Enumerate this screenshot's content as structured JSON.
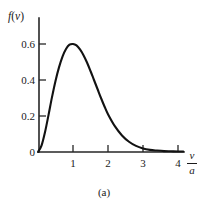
{
  "figure": {
    "caption": "(a)",
    "background_color": "#ffffff",
    "ink_color": "#1a1a1a"
  },
  "chart_data": {
    "type": "line",
    "title": "",
    "subtitle": "",
    "xlabel": "v/a",
    "xlabel_numerator": "v",
    "xlabel_denominator": "a",
    "ylabel": "f(v)",
    "xlim": [
      0,
      4.35
    ],
    "ylim": [
      0,
      0.68
    ],
    "grid": false,
    "legend": false,
    "xticks": [
      1,
      2,
      3,
      4
    ],
    "xtick_labels": [
      "1",
      "2",
      "3",
      "4"
    ],
    "yticks": [
      0,
      0.2,
      0.4,
      0.6
    ],
    "ytick_labels": [
      "0",
      "0.2",
      "0.4",
      "0.6"
    ],
    "series": [
      {
        "name": "f(v)",
        "color": "#121212",
        "x": [
          0.0,
          0.1,
          0.2,
          0.3,
          0.4,
          0.5,
          0.6,
          0.7,
          0.8,
          0.9,
          1.0,
          1.1,
          1.2,
          1.3,
          1.4,
          1.5,
          1.6,
          1.7,
          1.8,
          1.9,
          2.0,
          2.2,
          2.4,
          2.6,
          2.8,
          3.0,
          3.2,
          3.4,
          3.6,
          3.8,
          4.0,
          4.15
        ],
        "y": [
          0.0,
          0.035,
          0.11,
          0.205,
          0.305,
          0.395,
          0.47,
          0.53,
          0.572,
          0.596,
          0.6,
          0.592,
          0.57,
          0.538,
          0.497,
          0.45,
          0.4,
          0.35,
          0.3,
          0.253,
          0.21,
          0.142,
          0.092,
          0.057,
          0.034,
          0.02,
          0.012,
          0.008,
          0.005,
          0.004,
          0.003,
          0.003
        ]
      }
    ],
    "peak": {
      "x": 1.0,
      "y": 0.6
    },
    "annotations": []
  }
}
